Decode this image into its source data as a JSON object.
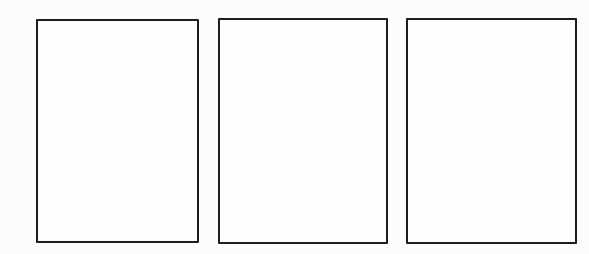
{
  "figure": {
    "background_color": "#fcfcfc",
    "panel_border_color": "#1d1d1d",
    "panel_fill_color": "#fdfdfd",
    "panel_count": 3
  },
  "panels": [
    {
      "name": "blank-panel-left",
      "label": ""
    },
    {
      "name": "blank-panel-center",
      "label": ""
    },
    {
      "name": "blank-panel-right",
      "label": ""
    }
  ]
}
